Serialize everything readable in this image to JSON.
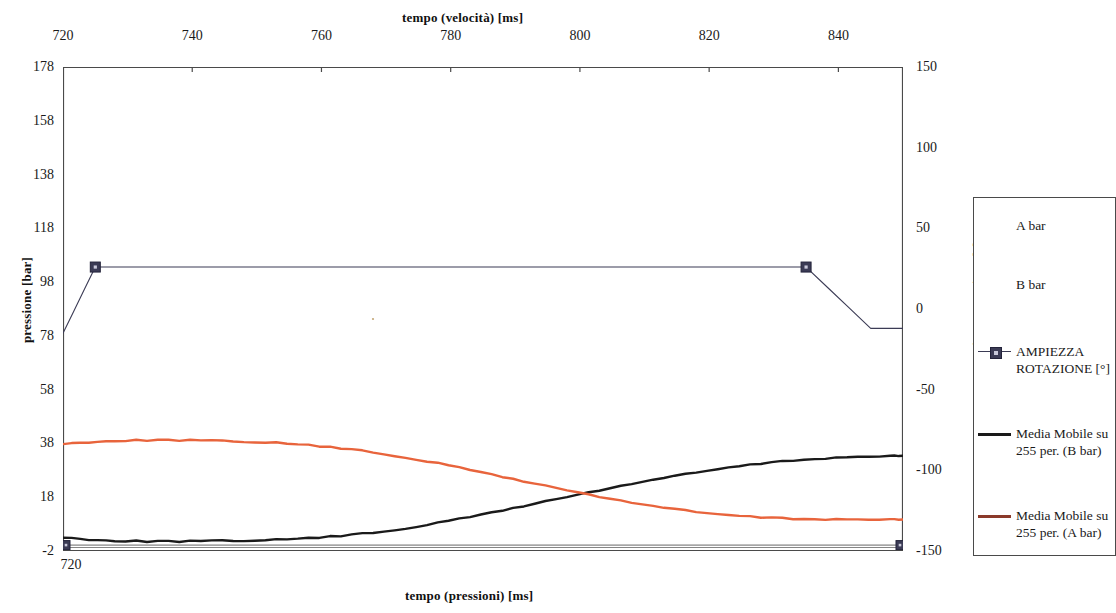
{
  "titles": {
    "top_axis": "tempo (velocità) [ms]",
    "bottom_axis": "tempo (pressioni) [ms]",
    "left_axis": "pressione [bar]",
    "right_axis": "Ampiezza rotazione [°]"
  },
  "axes": {
    "top_ticks": [
      "720",
      "740",
      "760",
      "780",
      "800",
      "820",
      "840"
    ],
    "bottom_ticks": [
      "720"
    ],
    "left_ticks": [
      "178",
      "158",
      "138",
      "118",
      "98",
      "78",
      "58",
      "38",
      "18",
      "-2"
    ],
    "right_ticks": [
      "150",
      "100",
      "50",
      "0",
      "-50",
      "-100",
      "-150"
    ]
  },
  "legend": {
    "items": [
      {
        "label": "A bar",
        "swatch": "none",
        "color": ""
      },
      {
        "label": "B bar",
        "swatch": "none",
        "color": ""
      },
      {
        "label": "AMPIEZZA ROTAZIONE [°]",
        "swatch": "line-marker",
        "color": "#3b3b55"
      },
      {
        "label": "Media Mobile su 255 per. (B bar)",
        "swatch": "line",
        "color": "#1a1a1a"
      },
      {
        "label": "Media Mobile su 255 per. (A bar)",
        "swatch": "line",
        "color": "#8b3a2a"
      }
    ]
  },
  "colors": {
    "rotation": "#3b3b55",
    "moving_avg_b": "#1a1a1a",
    "moving_avg_a": "#e8643c",
    "axis": "#4a4a4a",
    "background": "#ffffff"
  },
  "chart_data": {
    "type": "line",
    "title": "",
    "xlabel": "tempo (pressioni) [ms]",
    "xlabel_secondary": "tempo (velocità) [ms]",
    "ylabel": "pressione [bar]",
    "ylabel_secondary": "Ampiezza rotazione [°]",
    "grid": false,
    "legend_position": "right",
    "xlim": [
      720,
      850
    ],
    "ylim": [
      -2,
      178
    ],
    "ylim_secondary": [
      -150,
      150
    ],
    "xticks": [
      720,
      740,
      760,
      780,
      800,
      820,
      840
    ],
    "yticks": [
      -2,
      18,
      38,
      58,
      78,
      98,
      118,
      138,
      158,
      178
    ],
    "yticks_secondary": [
      -150,
      -100,
      -50,
      0,
      50,
      100,
      150
    ],
    "series": [
      {
        "name": "AMPIEZZA ROTAZIONE [°]",
        "axis": "secondary",
        "color": "#3b3b55",
        "marker": "square",
        "x": [
          720,
          725,
          835,
          845,
          850
        ],
        "values": [
          -15,
          26,
          26,
          -12,
          -12
        ]
      },
      {
        "name": "Media Mobile su 255 per. (B bar)",
        "axis": "primary",
        "color": "#1a1a1a",
        "x": [
          720,
          724,
          728,
          733,
          738,
          743,
          748,
          753,
          758,
          763,
          768,
          773,
          778,
          783,
          788,
          793,
          798,
          803,
          808,
          813,
          818,
          823,
          828,
          833,
          838,
          843,
          848,
          850
        ],
        "values": [
          3.0,
          2.3,
          1.8,
          1.6,
          1.6,
          1.7,
          1.9,
          2.2,
          2.8,
          3.6,
          4.8,
          6.4,
          8.4,
          10.7,
          13.1,
          15.6,
          18.1,
          20.6,
          23.0,
          25.2,
          27.2,
          29.0,
          30.5,
          31.7,
          32.5,
          33.0,
          33.3,
          33.4
        ]
      },
      {
        "name": "Media Mobile su 255 per. (A bar)",
        "axis": "primary",
        "color": "#e8643c",
        "x": [
          720,
          724,
          728,
          733,
          738,
          743,
          748,
          753,
          758,
          763,
          768,
          773,
          778,
          783,
          788,
          793,
          798,
          803,
          808,
          813,
          818,
          823,
          828,
          833,
          838,
          843,
          848,
          850
        ],
        "values": [
          37.8,
          38.5,
          39.0,
          39.2,
          39.2,
          39.0,
          38.7,
          38.2,
          37.4,
          36.2,
          34.7,
          32.8,
          30.6,
          28.2,
          25.6,
          23.1,
          20.6,
          18.2,
          16.0,
          14.1,
          12.5,
          11.3,
          10.5,
          10.0,
          9.8,
          9.7,
          9.7,
          9.7
        ]
      },
      {
        "name": "A bar",
        "axis": "primary",
        "color": "#555555",
        "x": [
          720,
          850
        ],
        "values": [
          0.2,
          0.2
        ]
      },
      {
        "name": "B bar",
        "axis": "primary",
        "color": "#777777",
        "x": [
          720,
          850
        ],
        "values": [
          -0.7,
          -0.7
        ]
      }
    ]
  }
}
